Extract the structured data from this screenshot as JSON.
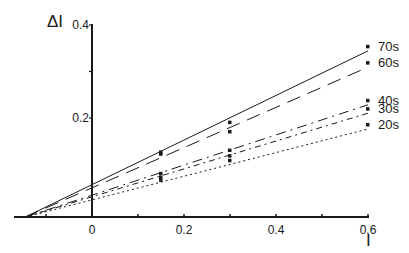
{
  "chart_data": {
    "type": "line",
    "title": "",
    "xlabel": "I",
    "ylabel": "ΔI",
    "xlim": [
      -0.17,
      0.6
    ],
    "ylim": [
      0,
      0.4
    ],
    "x_ticks": [
      "0",
      "0.2",
      "0.4",
      "0.6"
    ],
    "x_tick_values": [
      0,
      0.2,
      0.4,
      0.6
    ],
    "y_ticks": [
      "0.2",
      "0.4"
    ],
    "y_tick_values": [
      0.2,
      0.4
    ],
    "grid": false,
    "legend_position": "right, at line ends",
    "convergence_point": {
      "x": -0.145,
      "y": 0
    },
    "series": [
      {
        "name": "70s",
        "style": "solid",
        "line": {
          "x": [
            -0.145,
            0.6
          ],
          "y": [
            0.0,
            0.353
          ]
        },
        "points": {
          "x": [
            0.15,
            0.3,
            0.6
          ],
          "y": [
            0.126,
            0.19,
            0.353
          ]
        }
      },
      {
        "name": "60s",
        "style": "dashed",
        "line": {
          "x": [
            -0.145,
            0.6
          ],
          "y": [
            0.0,
            0.318
          ]
        },
        "points": {
          "x": [
            0.15,
            0.3,
            0.6
          ],
          "y": [
            0.122,
            0.17,
            0.318
          ]
        }
      },
      {
        "name": "40s",
        "style": "dashdot-long",
        "line": {
          "x": [
            -0.145,
            0.6
          ],
          "y": [
            0.0,
            0.237
          ]
        },
        "points": {
          "x": [
            0.15,
            0.3,
            0.6
          ],
          "y": [
            0.08,
            0.13,
            0.237
          ]
        }
      },
      {
        "name": "30s",
        "style": "dashdot",
        "line": {
          "x": [
            -0.145,
            0.6
          ],
          "y": [
            0.0,
            0.219
          ]
        },
        "points": {
          "x": [
            0.15,
            0.3,
            0.6
          ],
          "y": [
            0.072,
            0.118,
            0.219
          ]
        }
      },
      {
        "name": "20s",
        "style": "dotted",
        "line": {
          "x": [
            -0.145,
            0.6
          ],
          "y": [
            0.0,
            0.185
          ]
        },
        "points": {
          "x": [
            0.15,
            0.3,
            0.6
          ],
          "y": [
            0.066,
            0.108,
            0.185
          ]
        }
      }
    ]
  },
  "colors": {
    "ink": "#1a1a1a",
    "background": "#ffffff"
  }
}
